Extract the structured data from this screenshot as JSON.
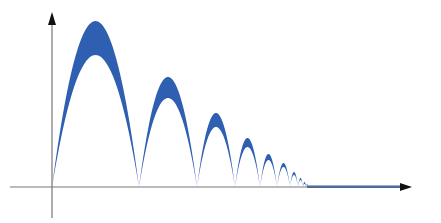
{
  "chart_data": {
    "type": "area",
    "title": "",
    "xlabel": "",
    "ylabel": "",
    "grid": false,
    "legend": null,
    "axes": {
      "x_arrow": true,
      "y_arrow": true,
      "ticks": []
    },
    "colors": {
      "fill": "#2f5fb0",
      "axis": "#777777",
      "arrow": "#111111"
    },
    "arcs": [
      {
        "x_start": 52,
        "x_end": 139,
        "outer_peak_y": 21,
        "inner_peak_y": 55
      },
      {
        "x_start": 139,
        "x_end": 197,
        "outer_peak_y": 77,
        "inner_peak_y": 98
      },
      {
        "x_start": 197,
        "x_end": 235,
        "outer_peak_y": 113,
        "inner_peak_y": 127
      },
      {
        "x_start": 235,
        "x_end": 260,
        "outer_peak_y": 138,
        "inner_peak_y": 147
      },
      {
        "x_start": 260,
        "x_end": 277,
        "outer_peak_y": 154,
        "inner_peak_y": 160
      },
      {
        "x_start": 277,
        "x_end": 290,
        "outer_peak_y": 163,
        "inner_peak_y": 167
      },
      {
        "x_start": 290,
        "x_end": 298,
        "outer_peak_y": 172,
        "inner_peak_y": 175
      },
      {
        "x_start": 298,
        "x_end": 303,
        "outer_peak_y": 178,
        "inner_peak_y": 180
      },
      {
        "x_start": 303,
        "x_end": 306,
        "outer_peak_y": 182,
        "inner_peak_y": 184
      },
      {
        "x_start": 306,
        "x_end": 308,
        "outer_peak_y": 184,
        "inner_peak_y": 185
      }
    ],
    "flat_band": {
      "x_start": 307,
      "x_end": 400,
      "y_top": 185.5,
      "y_bottom": 188
    },
    "origin": {
      "x": 52,
      "y": 187
    },
    "x_axis": {
      "x_start": 10,
      "x_end": 410
    },
    "y_axis": {
      "y_start": 15,
      "y_end": 218
    }
  }
}
